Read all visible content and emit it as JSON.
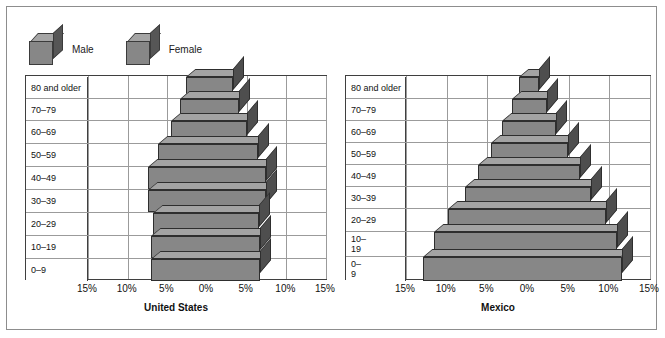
{
  "legend": {
    "items": [
      {
        "label": "Male",
        "icon": "cube-icon",
        "color": "#878787"
      },
      {
        "label": "Female",
        "icon": "cube-icon",
        "color": "#878787"
      }
    ]
  },
  "colors": {
    "bar_front": "#878787",
    "bar_top": "#a3a3a3",
    "bar_side": "#4e4e4e",
    "grid": "#9b9b9b",
    "axis": "#3f3f3f",
    "frame": "#8d8d8d",
    "background": "#ffffff"
  },
  "axis_ticks": [
    "15%",
    "10%",
    "5%",
    "0%",
    "5%",
    "10%",
    "15%"
  ],
  "chart_data": [
    {
      "type": "bar",
      "title": "United States",
      "subtype": "population-pyramid",
      "xlabel": "",
      "ylabel": "",
      "xlim": [
        -15,
        15
      ],
      "xticks": [
        -15,
        -10,
        -5,
        0,
        5,
        10,
        15
      ],
      "xticklabels": [
        "15%",
        "10%",
        "5%",
        "0%",
        "5%",
        "10%",
        "15%"
      ],
      "grid": true,
      "legend_position": "top-left",
      "categories": [
        "80 and older",
        "70–79",
        "60–69",
        "50–59",
        "40–49",
        "30–39",
        "20–29",
        "10–19",
        "0–9"
      ],
      "series": [
        {
          "name": "Male",
          "values": [
            2.6,
            3.4,
            4.6,
            6.2,
            7.5,
            7.5,
            6.8,
            7.0,
            7.0
          ]
        },
        {
          "name": "Female",
          "values": [
            3.3,
            4.0,
            5.0,
            6.4,
            7.4,
            7.4,
            6.6,
            6.7,
            6.7
          ]
        }
      ]
    },
    {
      "type": "bar",
      "title": "Mexico",
      "subtype": "population-pyramid",
      "xlabel": "",
      "ylabel": "",
      "xlim": [
        -15,
        15
      ],
      "xticks": [
        -15,
        -10,
        -5,
        0,
        5,
        10,
        15
      ],
      "xticklabels": [
        "15%",
        "10%",
        "5%",
        "0%",
        "5%",
        "10%",
        "15%"
      ],
      "grid": true,
      "legend_position": "top-left",
      "categories": [
        "80 and older",
        "70–79",
        "60–69",
        "50–59",
        "40–49",
        "30–39",
        "20–29",
        "10–19",
        "0–9"
      ],
      "category_labels_display": [
        "80 and older",
        "70–79",
        "60–69",
        "50–59",
        "40–49",
        "30–39",
        "20–29",
        "10–|19",
        "0–|9"
      ],
      "series": [
        {
          "name": "Male",
          "values": [
            1.1,
            2.0,
            3.2,
            4.6,
            6.1,
            7.7,
            9.8,
            11.6,
            12.9
          ]
        },
        {
          "name": "Female",
          "values": [
            1.4,
            2.3,
            3.5,
            4.9,
            6.4,
            7.8,
            9.6,
            11.0,
            11.5
          ]
        }
      ]
    }
  ]
}
